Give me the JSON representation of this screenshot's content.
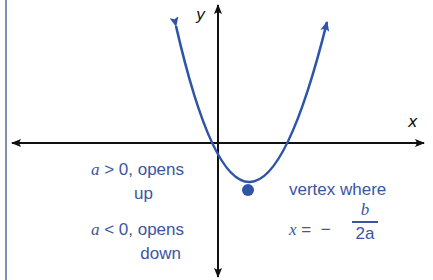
{
  "diagram": {
    "axes": {
      "x_label": "x",
      "y_label": "y"
    },
    "colors": {
      "curve": "#2f55a8",
      "axes": "#111111",
      "text": "#3b55a3",
      "border": "#7f8fb8"
    },
    "conditions": {
      "up": {
        "var": "a",
        "rel": " > 0, opens",
        "line2": "up"
      },
      "down": {
        "var": "a",
        "rel": " < 0, opens",
        "line2": "down"
      }
    },
    "vertex": {
      "line1": "vertex where",
      "eq_var": "x",
      "eq_sign": " =  −",
      "numerator": "b",
      "denominator": "2a"
    }
  }
}
